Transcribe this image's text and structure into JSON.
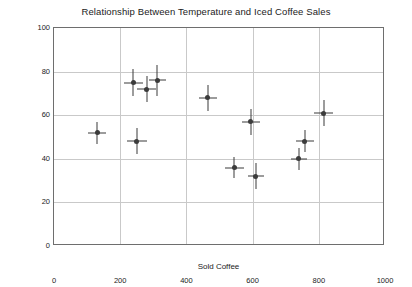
{
  "chart_data": {
    "type": "scatter",
    "title": "Relationship Between Temperature and Iced Coffee Sales",
    "xlabel": "Sold Coffee",
    "ylabel": "Temperature in Fahrenheit",
    "xlim": [
      0,
      1000
    ],
    "ylim": [
      0,
      100
    ],
    "xticks": [
      0,
      200,
      400,
      600,
      800,
      1000
    ],
    "yticks": [
      0,
      20,
      40,
      60,
      80,
      100
    ],
    "grid": true,
    "legend": "none",
    "marker_color": "#3b3b3b",
    "errorbar_color": "#3a3a3a",
    "series": [
      {
        "name": "Iced coffee sales vs temperature",
        "points": [
          {
            "x": 130,
            "y": 52,
            "xerr": 28,
            "yerr": 5
          },
          {
            "x": 240,
            "y": 75,
            "xerr": 30,
            "yerr": 6
          },
          {
            "x": 280,
            "y": 72,
            "xerr": 28,
            "yerr": 6
          },
          {
            "x": 312,
            "y": 76,
            "xerr": 25,
            "yerr": 7
          },
          {
            "x": 250,
            "y": 48,
            "xerr": 30,
            "yerr": 6
          },
          {
            "x": 465,
            "y": 68,
            "xerr": 26,
            "yerr": 6
          },
          {
            "x": 595,
            "y": 57,
            "xerr": 28,
            "yerr": 6
          },
          {
            "x": 545,
            "y": 36,
            "xerr": 28,
            "yerr": 5
          },
          {
            "x": 610,
            "y": 32,
            "xerr": 25,
            "yerr": 6
          },
          {
            "x": 740,
            "y": 40,
            "xerr": 24,
            "yerr": 5
          },
          {
            "x": 758,
            "y": 48,
            "xerr": 28,
            "yerr": 5
          },
          {
            "x": 815,
            "y": 61,
            "xerr": 28,
            "yerr": 6
          }
        ]
      }
    ]
  }
}
